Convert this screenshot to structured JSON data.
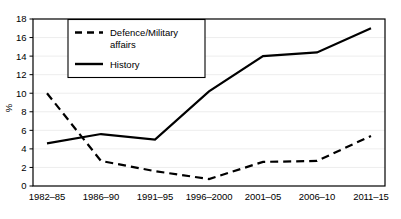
{
  "chart_data": {
    "type": "line",
    "title": "",
    "xlabel": "",
    "ylabel": "%",
    "categories": [
      "1982–85",
      "1986–90",
      "1991–95",
      "1996–2000",
      "2001–05",
      "2006–10",
      "2011–15"
    ],
    "ylim": [
      0,
      18
    ],
    "yticks": [
      0,
      2,
      4,
      6,
      8,
      10,
      12,
      14,
      16,
      18
    ],
    "ytick_labels": [
      "0",
      "2",
      "4",
      "6",
      "8",
      "10",
      "12",
      "14",
      "16",
      "18"
    ],
    "grid": true,
    "legend_position": "top-left-inside",
    "series": [
      {
        "name": "Defence/Military affairs",
        "style": "dashed",
        "color": "#000000",
        "values": [
          10.0,
          2.7,
          1.6,
          0.75,
          2.6,
          2.7,
          5.4
        ]
      },
      {
        "name": "History",
        "style": "solid",
        "color": "#000000",
        "values": [
          4.6,
          5.6,
          5.0,
          10.2,
          14.0,
          14.4,
          17.0
        ]
      }
    ]
  },
  "legend": {
    "items": [
      {
        "label": "Defence/Military affairs",
        "style": "dashed"
      },
      {
        "label": "History",
        "style": "solid"
      }
    ]
  },
  "axes": {
    "y_axis_title": "%"
  }
}
